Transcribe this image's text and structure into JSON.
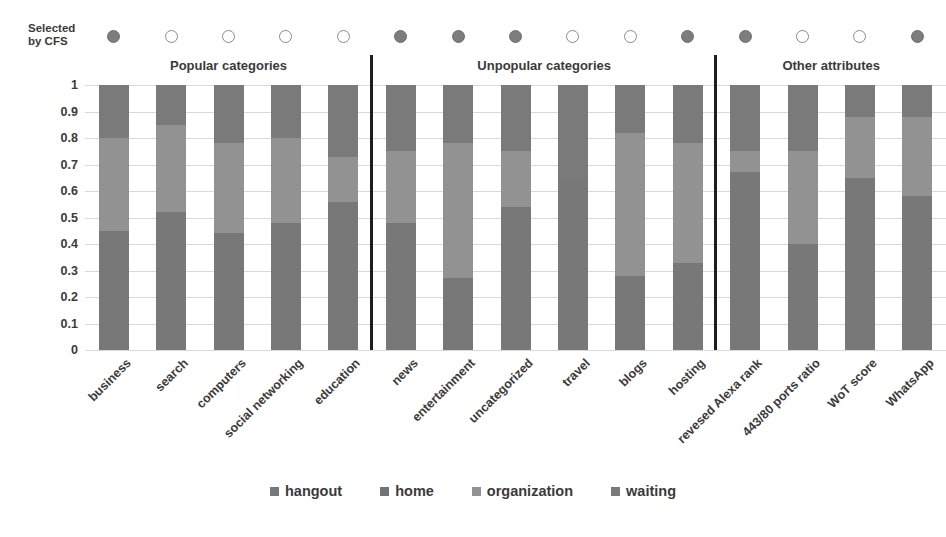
{
  "cfs": {
    "label_line1": "Selected",
    "label_line2": "by CFS",
    "markers": [
      {
        "category": "business",
        "selected": true
      },
      {
        "category": "search",
        "selected": false
      },
      {
        "category": "computers",
        "selected": false
      },
      {
        "category": "social networking",
        "selected": false
      },
      {
        "category": "education",
        "selected": false
      },
      {
        "category": "news",
        "selected": true
      },
      {
        "category": "entertainment",
        "selected": true
      },
      {
        "category": "uncategorized",
        "selected": true
      },
      {
        "category": "travel",
        "selected": false
      },
      {
        "category": "blogs",
        "selected": false
      },
      {
        "category": "hosting",
        "selected": true
      },
      {
        "category": "revesed Alexa rank",
        "selected": true
      },
      {
        "category": "443/80 ports ratio",
        "selected": false
      },
      {
        "category": "WoT score",
        "selected": false
      },
      {
        "category": "WhatsApp",
        "selected": true
      }
    ]
  },
  "groups": [
    {
      "title": "Popular categories",
      "start": 0,
      "end": 4
    },
    {
      "title": "Unpopular categories",
      "start": 5,
      "end": 10
    },
    {
      "title": "Other attributes",
      "start": 11,
      "end": 14
    }
  ],
  "colors": {
    "hangout": "#787878",
    "home": "#737373",
    "organization": "#929292",
    "waiting": "#7a7a7a",
    "gridline": "#d9d9d9",
    "divider": "#1d1d1d",
    "marker_filled": "#7d7d7d",
    "marker_hollow_border": "#8a8a8a",
    "text": "#3a3a3a"
  },
  "chart_data": {
    "type": "bar",
    "title": "",
    "stacked": true,
    "normalized": true,
    "xlabel": "",
    "ylabel": "",
    "ylim": [
      0,
      1
    ],
    "yticks": [
      "0",
      "0.1",
      "0.2",
      "0.3",
      "0.4",
      "0.5",
      "0.6",
      "0.7",
      "0.8",
      "0.9",
      "1"
    ],
    "grid": true,
    "legend_position": "bottom",
    "categories": [
      "business",
      "search",
      "computers",
      "social networking",
      "education",
      "news",
      "entertainment",
      "uncategorized",
      "travel",
      "blogs",
      "hosting",
      "revesed Alexa rank",
      "443/80 ports ratio",
      "WoT score",
      "WhatsApp"
    ],
    "series": [
      {
        "name": "hangout",
        "values": [
          0.45,
          0.52,
          0.44,
          0.48,
          0.56,
          0.48,
          0.27,
          0.54,
          0.65,
          0.28,
          0.33,
          0.67,
          0.4,
          0.65,
          0.58
        ]
      },
      {
        "name": "home",
        "values": [
          0.0,
          0.0,
          0.0,
          0.0,
          0.0,
          0.0,
          0.0,
          0.0,
          0.0,
          0.0,
          0.0,
          0.0,
          0.0,
          0.0,
          0.0
        ]
      },
      {
        "name": "organization",
        "values": [
          0.35,
          0.33,
          0.34,
          0.32,
          0.17,
          0.27,
          0.51,
          0.21,
          0.0,
          0.54,
          0.45,
          0.08,
          0.35,
          0.23,
          0.3
        ]
      },
      {
        "name": "waiting",
        "values": [
          0.2,
          0.15,
          0.22,
          0.2,
          0.27,
          0.25,
          0.22,
          0.25,
          0.35,
          0.18,
          0.22,
          0.25,
          0.25,
          0.12,
          0.12
        ]
      }
    ],
    "legend": [
      "hangout",
      "home",
      "organization",
      "waiting"
    ]
  },
  "legend": {
    "items": [
      {
        "label": "hangout",
        "color": "#787878"
      },
      {
        "label": "home",
        "color": "#737373"
      },
      {
        "label": "organization",
        "color": "#929292"
      },
      {
        "label": "waiting",
        "color": "#7a7a7a"
      }
    ]
  }
}
